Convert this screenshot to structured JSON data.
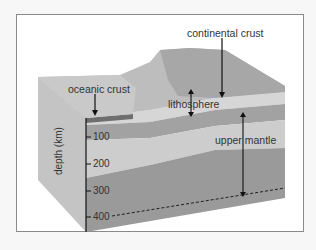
{
  "diagram": {
    "labels": {
      "continental_crust": "continental crust",
      "oceanic_crust": "oceanic crust",
      "lithosphere": "lithosphere",
      "upper_mantle": "upper mantle"
    },
    "axis": {
      "label": "depth (km)",
      "ticks": [
        "100",
        "200",
        "300",
        "400"
      ]
    },
    "colors": {
      "frame_border": "#8a8a8a",
      "surface_light": "#c9c9c9",
      "surface_dark": "#9e9e9e",
      "crust_band": "#d8d8d8",
      "lithosphere_band": "#a3a3a3",
      "mantle_light": "#cfcfcf",
      "mantle_dark": "#9a9a9a",
      "oceanic_crust": "#6e6e6e",
      "arrow": "#111111"
    }
  }
}
